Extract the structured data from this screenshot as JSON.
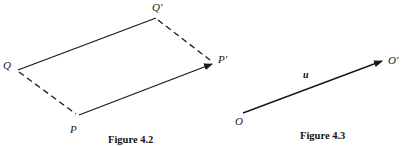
{
  "page": {
    "background_color": "#ffffff",
    "ink_color": "#1a1a1a",
    "width": 403,
    "height": 146
  },
  "figures": [
    {
      "id": "figure-4-2",
      "caption": "Figure 4.2",
      "caption_clipped": true,
      "description": "parallelogram with vertices Q, Q', P, P'",
      "labels": [
        {
          "name": "Q",
          "text": "Q"
        },
        {
          "name": "Q'",
          "text": "Q′"
        },
        {
          "name": "P",
          "text": "P"
        },
        {
          "name": "P'",
          "text": "P′"
        }
      ],
      "edges": [
        {
          "from": "Q",
          "to": "Q'",
          "style": "solid",
          "arrow": false
        },
        {
          "from": "Q'",
          "to": "P'",
          "style": "dashed",
          "arrow": false
        },
        {
          "from": "Q",
          "to": "P",
          "style": "dashed",
          "arrow": false
        },
        {
          "from": "P",
          "to": "P'",
          "style": "solid",
          "arrow": true
        }
      ]
    },
    {
      "id": "figure-4-3",
      "caption": "Figure 4.3",
      "caption_clipped": false,
      "description": "vector u from O to O'",
      "labels": [
        {
          "name": "O",
          "text": "O"
        },
        {
          "name": "O'",
          "text": "O′"
        },
        {
          "name": "u",
          "text": "u"
        }
      ],
      "edges": [
        {
          "from": "O",
          "to": "O'",
          "style": "solid",
          "arrow": true
        }
      ]
    }
  ],
  "geometry": {
    "parallelogram": {
      "Q": {
        "x": 18,
        "y": 70
      },
      "Qp": {
        "x": 156,
        "y": 18
      },
      "P": {
        "x": 79,
        "y": 115
      },
      "Pp": {
        "x": 215,
        "y": 62
      }
    },
    "vector": {
      "O": {
        "x": 243,
        "y": 113
      },
      "Op": {
        "x": 385,
        "y": 60
      }
    }
  }
}
